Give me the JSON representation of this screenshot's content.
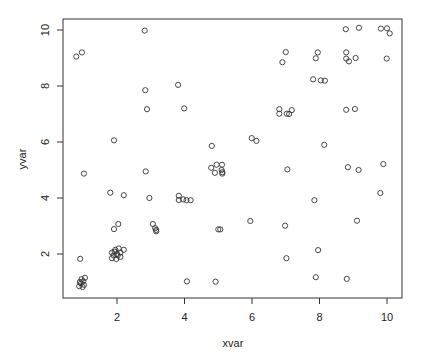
{
  "chart_data": {
    "type": "scatter",
    "title": "",
    "xlabel": "xvar",
    "ylabel": "yvar",
    "xlim": [
      0.6,
      10.3
    ],
    "ylim": [
      0.6,
      10.3
    ],
    "x_ticks": [
      2,
      4,
      6,
      8,
      10
    ],
    "y_ticks": [
      2,
      4,
      6,
      8,
      10
    ],
    "grid": false,
    "legend": null,
    "marker": "open-circle",
    "points": [
      {
        "x": 0.79,
        "y": 9.05
      },
      {
        "x": 0.96,
        "y": 9.2
      },
      {
        "x": 2.82,
        "y": 9.98
      },
      {
        "x": 2.84,
        "y": 7.85
      },
      {
        "x": 2.89,
        "y": 7.17
      },
      {
        "x": 3.81,
        "y": 8.04
      },
      {
        "x": 3.99,
        "y": 7.2
      },
      {
        "x": 7.0,
        "y": 9.21
      },
      {
        "x": 6.9,
        "y": 8.85
      },
      {
        "x": 8.78,
        "y": 10.03
      },
      {
        "x": 9.17,
        "y": 10.08
      },
      {
        "x": 9.82,
        "y": 10.05
      },
      {
        "x": 10.0,
        "y": 10.06
      },
      {
        "x": 10.08,
        "y": 9.88
      },
      {
        "x": 7.95,
        "y": 9.2
      },
      {
        "x": 7.89,
        "y": 8.99
      },
      {
        "x": 8.79,
        "y": 9.2
      },
      {
        "x": 8.79,
        "y": 8.98
      },
      {
        "x": 8.87,
        "y": 8.88
      },
      {
        "x": 9.07,
        "y": 9.0
      },
      {
        "x": 9.99,
        "y": 8.98
      },
      {
        "x": 7.81,
        "y": 8.24
      },
      {
        "x": 8.04,
        "y": 8.2
      },
      {
        "x": 8.16,
        "y": 8.19
      },
      {
        "x": 6.81,
        "y": 7.17
      },
      {
        "x": 6.81,
        "y": 7.01
      },
      {
        "x": 7.03,
        "y": 7.01
      },
      {
        "x": 7.1,
        "y": 7.0
      },
      {
        "x": 7.18,
        "y": 7.14
      },
      {
        "x": 8.79,
        "y": 7.15
      },
      {
        "x": 9.05,
        "y": 7.18
      },
      {
        "x": 1.91,
        "y": 6.06
      },
      {
        "x": 1.02,
        "y": 4.87
      },
      {
        "x": 2.85,
        "y": 4.95
      },
      {
        "x": 1.8,
        "y": 4.19
      },
      {
        "x": 2.2,
        "y": 4.1
      },
      {
        "x": 2.96,
        "y": 4.0
      },
      {
        "x": 3.83,
        "y": 4.08
      },
      {
        "x": 3.83,
        "y": 3.93
      },
      {
        "x": 3.96,
        "y": 3.95
      },
      {
        "x": 4.06,
        "y": 3.92
      },
      {
        "x": 4.18,
        "y": 3.92
      },
      {
        "x": 4.81,
        "y": 5.86
      },
      {
        "x": 5.99,
        "y": 6.14
      },
      {
        "x": 6.13,
        "y": 6.04
      },
      {
        "x": 4.79,
        "y": 5.08
      },
      {
        "x": 4.95,
        "y": 5.19
      },
      {
        "x": 5.11,
        "y": 5.19
      },
      {
        "x": 4.9,
        "y": 4.9
      },
      {
        "x": 5.1,
        "y": 5.0
      },
      {
        "x": 5.12,
        "y": 4.92
      },
      {
        "x": 5.12,
        "y": 4.87
      },
      {
        "x": 7.05,
        "y": 5.02
      },
      {
        "x": 8.14,
        "y": 5.9
      },
      {
        "x": 8.84,
        "y": 5.1
      },
      {
        "x": 9.16,
        "y": 5.0
      },
      {
        "x": 9.89,
        "y": 5.21
      },
      {
        "x": 9.8,
        "y": 4.18
      },
      {
        "x": 7.85,
        "y": 3.92
      },
      {
        "x": 9.11,
        "y": 3.19
      },
      {
        "x": 5.95,
        "y": 3.18
      },
      {
        "x": 6.98,
        "y": 3.01
      },
      {
        "x": 5.0,
        "y": 2.88
      },
      {
        "x": 5.06,
        "y": 2.88
      },
      {
        "x": 7.02,
        "y": 1.85
      },
      {
        "x": 7.96,
        "y": 2.14
      },
      {
        "x": 4.07,
        "y": 1.02
      },
      {
        "x": 4.92,
        "y": 1.01
      },
      {
        "x": 7.89,
        "y": 1.17
      },
      {
        "x": 8.81,
        "y": 1.11
      },
      {
        "x": 1.91,
        "y": 2.89
      },
      {
        "x": 2.04,
        "y": 3.07
      },
      {
        "x": 3.06,
        "y": 3.07
      },
      {
        "x": 3.13,
        "y": 2.92
      },
      {
        "x": 3.16,
        "y": 2.86
      },
      {
        "x": 3.16,
        "y": 2.81
      },
      {
        "x": 0.91,
        "y": 1.83
      },
      {
        "x": 1.85,
        "y": 2.05
      },
      {
        "x": 1.95,
        "y": 2.15
      },
      {
        "x": 2.05,
        "y": 2.2
      },
      {
        "x": 2.2,
        "y": 2.15
      },
      {
        "x": 1.9,
        "y": 1.95
      },
      {
        "x": 2.0,
        "y": 2.0
      },
      {
        "x": 2.1,
        "y": 2.05
      },
      {
        "x": 1.85,
        "y": 1.85
      },
      {
        "x": 1.98,
        "y": 1.82
      },
      {
        "x": 2.1,
        "y": 1.9
      },
      {
        "x": 2.02,
        "y": 1.95
      },
      {
        "x": 1.93,
        "y": 2.08
      },
      {
        "x": 0.95,
        "y": 1.1
      },
      {
        "x": 1.05,
        "y": 1.15
      },
      {
        "x": 0.9,
        "y": 1.0
      },
      {
        "x": 1.0,
        "y": 1.02
      },
      {
        "x": 0.88,
        "y": 0.85
      },
      {
        "x": 0.98,
        "y": 0.82
      },
      {
        "x": 0.93,
        "y": 0.95
      },
      {
        "x": 1.02,
        "y": 0.9
      }
    ]
  },
  "plot": {
    "xlabel": "xvar",
    "ylabel": "yvar",
    "x_tick_labels": [
      "2",
      "4",
      "6",
      "8",
      "10"
    ],
    "y_tick_labels": [
      "2",
      "4",
      "6",
      "8",
      "10"
    ]
  }
}
